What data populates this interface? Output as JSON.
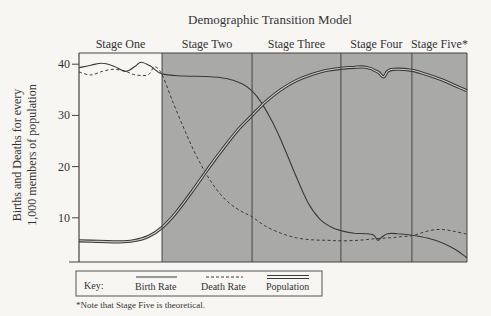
{
  "chart_data": {
    "type": "line",
    "title": "Demographic Transition Model",
    "xlabel": "",
    "ylabel_lines": [
      "Births and Deaths for every",
      "1,000 members of population"
    ],
    "xlim": [
      0,
      100
    ],
    "ylim": [
      0,
      42
    ],
    "yticks": [
      10,
      20,
      30,
      40
    ],
    "grid": false,
    "stages": [
      {
        "label": "Stage One",
        "start": 0,
        "end": 21.4,
        "shaded": false
      },
      {
        "label": "Stage Two",
        "start": 21.4,
        "end": 44.6,
        "shaded": true
      },
      {
        "label": "Stage Three",
        "start": 44.6,
        "end": 67.5,
        "shaded": true
      },
      {
        "label": "Stage Four",
        "start": 67.5,
        "end": 85.8,
        "shaded": true
      },
      {
        "label": "Stage Five*",
        "start": 85.8,
        "end": 100,
        "shaded": true
      }
    ],
    "series": [
      {
        "name": "Birth Rate",
        "style": "solid",
        "points": [
          [
            0,
            39.3
          ],
          [
            3,
            39.8
          ],
          [
            6,
            40.2
          ],
          [
            9,
            39.6
          ],
          [
            12,
            38.6
          ],
          [
            14.5,
            39.6
          ],
          [
            16,
            40.4
          ],
          [
            18.5,
            39.6
          ],
          [
            21.4,
            38.1
          ],
          [
            27,
            37.7
          ],
          [
            33,
            37.6
          ],
          [
            38,
            37.2
          ],
          [
            42,
            36.2
          ],
          [
            44.6,
            34.8
          ],
          [
            47,
            32.5
          ],
          [
            50,
            28.5
          ],
          [
            53,
            23.5
          ],
          [
            56,
            18.0
          ],
          [
            59,
            13.0
          ],
          [
            62,
            9.8
          ],
          [
            65,
            8.2
          ],
          [
            67.5,
            7.5
          ],
          [
            71,
            7.0
          ],
          [
            74,
            6.9
          ],
          [
            76,
            6.6
          ],
          [
            77,
            5.6
          ],
          [
            78,
            6.2
          ],
          [
            79.5,
            6.9
          ],
          [
            82,
            6.9
          ],
          [
            85.8,
            6.6
          ],
          [
            90,
            6.0
          ],
          [
            94,
            5.0
          ],
          [
            97,
            3.8
          ],
          [
            100,
            2.2
          ]
        ]
      },
      {
        "name": "Death Rate",
        "style": "dashed",
        "points": [
          [
            0,
            38.5
          ],
          [
            3,
            37.9
          ],
          [
            6,
            38.6
          ],
          [
            9,
            39.0
          ],
          [
            12,
            38.6
          ],
          [
            14,
            38.0
          ],
          [
            16,
            37.8
          ],
          [
            18,
            38.0
          ],
          [
            19.5,
            39.5
          ],
          [
            21.4,
            38.0
          ],
          [
            24,
            33.0
          ],
          [
            27,
            27.5
          ],
          [
            30,
            22.5
          ],
          [
            33,
            18.3
          ],
          [
            36,
            15.0
          ],
          [
            39,
            12.7
          ],
          [
            42,
            11.2
          ],
          [
            44.6,
            10.2
          ],
          [
            48,
            8.4
          ],
          [
            52,
            7.0
          ],
          [
            56,
            6.1
          ],
          [
            60,
            5.7
          ],
          [
            64,
            5.6
          ],
          [
            67.5,
            5.5
          ],
          [
            72,
            5.6
          ],
          [
            76,
            5.9
          ],
          [
            80,
            6.1
          ],
          [
            83,
            6.3
          ],
          [
            85.8,
            6.5
          ],
          [
            88,
            7.0
          ],
          [
            91,
            7.6
          ],
          [
            94,
            7.7
          ],
          [
            97,
            7.3
          ],
          [
            100,
            6.8
          ]
        ]
      },
      {
        "name": "Population",
        "style": "double",
        "points": [
          [
            0,
            5.5
          ],
          [
            5,
            5.4
          ],
          [
            10,
            5.3
          ],
          [
            14,
            5.5
          ],
          [
            18,
            6.4
          ],
          [
            21.4,
            8.1
          ],
          [
            25,
            11.0
          ],
          [
            29,
            15.0
          ],
          [
            33,
            19.3
          ],
          [
            37,
            23.4
          ],
          [
            41,
            27.2
          ],
          [
            44.6,
            30.0
          ],
          [
            48,
            32.6
          ],
          [
            52,
            35.0
          ],
          [
            56,
            36.8
          ],
          [
            60,
            38.0
          ],
          [
            64,
            38.8
          ],
          [
            67.5,
            39.2
          ],
          [
            71,
            39.4
          ],
          [
            74,
            39.4
          ],
          [
            77,
            38.5
          ],
          [
            78.5,
            37.5
          ],
          [
            79.5,
            38.6
          ],
          [
            81,
            39.0
          ],
          [
            85.8,
            38.8
          ],
          [
            90,
            37.9
          ],
          [
            94,
            36.8
          ],
          [
            97,
            35.8
          ],
          [
            100,
            34.8
          ]
        ]
      }
    ],
    "legend": {
      "position": "bottom-left",
      "key_label": "Key:",
      "entries": [
        "Birth Rate",
        "Death Rate",
        "Population"
      ]
    },
    "footnote": "*Note that Stage Five is theoretical."
  },
  "colors": {
    "shade": "#a9a9a7",
    "line": "#3a3a3a",
    "frame": "#444444",
    "background": "#f7f6f3"
  }
}
